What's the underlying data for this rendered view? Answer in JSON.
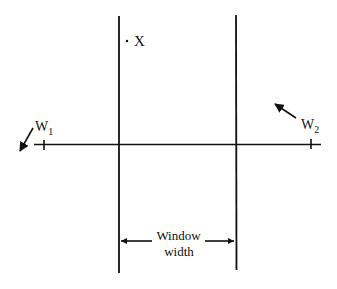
{
  "diagram": {
    "type": "window-classifier-illustration",
    "colors": {
      "ink": "#111111",
      "background": "#ffffff"
    },
    "point": {
      "label": "X",
      "marker": "dot"
    },
    "prototypes": [
      {
        "label": "W",
        "subscript": "1",
        "arrow_direction": "down-left"
      },
      {
        "label": "W",
        "subscript": "2",
        "arrow_direction": "up-left"
      }
    ],
    "window": {
      "label_line1": "Window",
      "label_line2": "width",
      "arrow": "double-headed"
    },
    "axis": {
      "orientation": "horizontal"
    }
  }
}
